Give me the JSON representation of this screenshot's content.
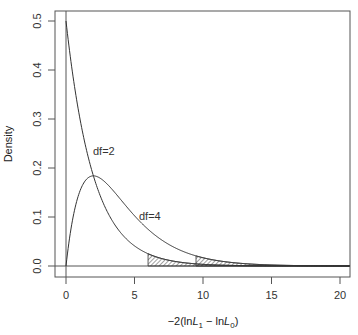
{
  "chart_data": {
    "type": "line",
    "title": "",
    "xlabel": "−2(lnL₁ − lnL₀)",
    "ylabel": "Density",
    "xlim": [
      0,
      20
    ],
    "ylim": [
      0,
      0.5
    ],
    "x_ticks": [
      "0",
      "5",
      "10",
      "15",
      "20"
    ],
    "y_ticks": [
      "0.0",
      "0.1",
      "0.2",
      "0.3",
      "0.4",
      "0.5"
    ],
    "grid": false,
    "legend": "none",
    "annotations": [
      {
        "text": "df=2",
        "x": 2.0,
        "y": 0.235
      },
      {
        "text": "df=4",
        "x": 5.3,
        "y": 0.102
      }
    ],
    "x": [
      0,
      0.5,
      1,
      1.5,
      2,
      2.5,
      3,
      3.5,
      4,
      4.5,
      5,
      5.5,
      6,
      6.5,
      7,
      7.5,
      8,
      8.5,
      9,
      9.5,
      10,
      11,
      12,
      13,
      14,
      15,
      16,
      17,
      18,
      19,
      20
    ],
    "series": [
      {
        "name": "df=2",
        "values": [
          0.5,
          0.389,
          0.303,
          0.236,
          0.184,
          0.143,
          0.112,
          0.087,
          0.068,
          0.053,
          0.041,
          0.032,
          0.025,
          0.019,
          0.015,
          0.012,
          0.009,
          0.007,
          0.006,
          0.004,
          0.003,
          0.002,
          0.001,
          0.001,
          0.0,
          0.0,
          0.0,
          0.0,
          0.0,
          0.0,
          0.0
        ]
      },
      {
        "name": "df=4",
        "values": [
          0.0,
          0.097,
          0.152,
          0.177,
          0.184,
          0.179,
          0.167,
          0.152,
          0.135,
          0.119,
          0.103,
          0.088,
          0.075,
          0.063,
          0.053,
          0.044,
          0.037,
          0.03,
          0.025,
          0.021,
          0.017,
          0.011,
          0.007,
          0.005,
          0.003,
          0.002,
          0.001,
          0.001,
          0.001,
          0.0,
          0.0
        ]
      }
    ],
    "shaded_regions": [
      {
        "series": "df=2",
        "from": 5.99,
        "to": 20,
        "fill": "hatched"
      },
      {
        "series": "df=4",
        "from": 9.49,
        "to": 20,
        "fill": "hatched"
      }
    ]
  },
  "labels": {
    "ylabel": "Density",
    "xlabel_prefix": "−2(ln",
    "xlabel_L": "L",
    "xlabel_sub1": "1",
    "xlabel_mid": " − ln",
    "xlabel_sub0": "0",
    "xlabel_suffix": ")",
    "df2": "df=2",
    "df4": "df=4",
    "x_ticks": [
      "0",
      "5",
      "10",
      "15",
      "20"
    ],
    "y_ticks": [
      "0.0",
      "0.1",
      "0.2",
      "0.3",
      "0.4",
      "0.5"
    ]
  }
}
